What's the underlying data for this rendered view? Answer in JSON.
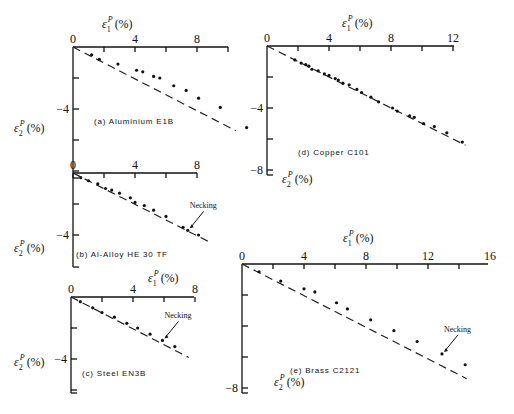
{
  "figure": {
    "x_axis_label": "ε1ᴾ (%)",
    "y_axis_label": "ε2ᴾ (%)",
    "necking_label": "Necking"
  },
  "chart_data": [
    {
      "id": "a",
      "type": "scatter",
      "title": "(a) Aluminium E1B",
      "xlabel": "ε1ᴾ (%)",
      "ylabel": "ε2ᴾ (%)",
      "xlim": [
        0,
        10
      ],
      "ylim": [
        -5.8,
        0
      ],
      "x_ticks": [
        0,
        4,
        8
      ],
      "y_ticks": [
        -4
      ],
      "fit_line": {
        "x": [
          0,
          10.5
        ],
        "y": [
          0,
          -5.4
        ],
        "style": "dashed"
      },
      "points": [
        [
          1.2,
          -0.5
        ],
        [
          1.7,
          -0.8
        ],
        [
          2.9,
          -1.1
        ],
        [
          4.1,
          -1.5
        ],
        [
          4.5,
          -1.6
        ],
        [
          5.2,
          -1.9
        ],
        [
          5.6,
          -2.0
        ],
        [
          6.5,
          -2.5
        ],
        [
          7.3,
          -2.8
        ],
        [
          8.1,
          -3.3
        ],
        [
          9.5,
          -3.9
        ],
        [
          11.2,
          -5.2
        ]
      ],
      "annotations": []
    },
    {
      "id": "b",
      "type": "scatter",
      "title": "(b) Al-Alloy HE 30 TF",
      "xlabel": "ε1ᴾ (%)",
      "ylabel": "ε2ᴾ (%)",
      "xlim": [
        0,
        8
      ],
      "ylim": [
        -6,
        0
      ],
      "x_ticks": [
        0,
        4,
        8
      ],
      "y_ticks": [
        -4
      ],
      "fit_line": {
        "x": [
          0,
          8.7
        ],
        "y": [
          0,
          -4.4
        ],
        "style": "dashed"
      },
      "points": [
        [
          0.5,
          -0.3
        ],
        [
          1.0,
          -0.5
        ],
        [
          1.6,
          -0.7
        ],
        [
          2.1,
          -1.0
        ],
        [
          2.5,
          -1.1
        ],
        [
          3.0,
          -1.3
        ],
        [
          3.7,
          -1.6
        ],
        [
          4.0,
          -1.9
        ],
        [
          4.6,
          -2.1
        ],
        [
          5.2,
          -2.4
        ],
        [
          6.0,
          -2.8
        ],
        [
          7.1,
          -3.5
        ],
        [
          7.4,
          -3.7
        ],
        [
          8.1,
          -4.0
        ]
      ],
      "annotations": [
        {
          "text": "Necking",
          "x": 7.4,
          "y": -3.7
        }
      ]
    },
    {
      "id": "c",
      "type": "scatter",
      "title": "(c) Steel EN3B",
      "xlabel": "ε1ᴾ (%)",
      "ylabel": "ε2ᴾ (%)",
      "xlim": [
        0,
        8
      ],
      "ylim": [
        -6,
        0
      ],
      "x_ticks": [
        0,
        4,
        8
      ],
      "y_ticks": [
        -4
      ],
      "fit_line": {
        "x": [
          0,
          7.6
        ],
        "y": [
          0,
          -3.9
        ],
        "style": "dashed"
      },
      "points": [
        [
          0.6,
          -0.3
        ],
        [
          1.4,
          -0.7
        ],
        [
          2.0,
          -1.0
        ],
        [
          2.8,
          -1.3
        ],
        [
          3.6,
          -1.7
        ],
        [
          4.3,
          -2.0
        ],
        [
          5.1,
          -2.4
        ],
        [
          5.9,
          -2.8
        ],
        [
          6.7,
          -3.2
        ]
      ],
      "annotations": [
        {
          "text": "Necking",
          "x": 5.9,
          "y": -2.8
        }
      ]
    },
    {
      "id": "d",
      "type": "scatter",
      "title": "(d) Copper C101",
      "xlabel": "ε1ᴾ (%)",
      "ylabel": "ε2ᴾ (%)",
      "xlim": [
        0,
        12
      ],
      "ylim": [
        -8,
        0
      ],
      "x_ticks": [
        0,
        4,
        8,
        12
      ],
      "y_ticks": [
        -4,
        -8
      ],
      "fit_line": {
        "x": [
          0,
          12.8
        ],
        "y": [
          0,
          -6.4
        ],
        "style": "dashed"
      },
      "points": [
        [
          1.8,
          -0.9
        ],
        [
          2.2,
          -1.1
        ],
        [
          2.5,
          -1.2
        ],
        [
          2.7,
          -1.3
        ],
        [
          2.9,
          -1.5
        ],
        [
          3.3,
          -1.6
        ],
        [
          3.7,
          -1.8
        ],
        [
          4.0,
          -1.9
        ],
        [
          4.4,
          -2.1
        ],
        [
          4.6,
          -2.2
        ],
        [
          4.9,
          -2.4
        ],
        [
          5.3,
          -2.5
        ],
        [
          5.8,
          -2.8
        ],
        [
          6.1,
          -3.0
        ],
        [
          6.7,
          -3.3
        ],
        [
          7.2,
          -3.6
        ],
        [
          8.1,
          -4.0
        ],
        [
          8.4,
          -4.2
        ],
        [
          9.2,
          -4.5
        ],
        [
          9.5,
          -4.6
        ],
        [
          10.1,
          -5.0
        ],
        [
          10.8,
          -5.2
        ],
        [
          11.6,
          -5.6
        ],
        [
          12.6,
          -6.2
        ]
      ],
      "annotations": []
    },
    {
      "id": "e",
      "type": "scatter",
      "title": "(e) Brass C2121",
      "xlabel": "ε1ᴾ (%)",
      "ylabel": "ε2ᴾ (%)",
      "xlim": [
        0,
        16
      ],
      "ylim": [
        -8,
        0
      ],
      "x_ticks": [
        0,
        4,
        8,
        12,
        16
      ],
      "y_ticks": [
        -8
      ],
      "fit_line": {
        "x": [
          0,
          14.5
        ],
        "y": [
          0,
          -7.4
        ],
        "style": "dashed"
      },
      "points": [
        [
          1.1,
          -0.5
        ],
        [
          2.5,
          -1.1
        ],
        [
          4.0,
          -1.6
        ],
        [
          4.7,
          -1.8
        ],
        [
          6.1,
          -2.5
        ],
        [
          6.8,
          -2.9
        ],
        [
          8.3,
          -3.6
        ],
        [
          9.8,
          -4.3
        ],
        [
          11.3,
          -5.0
        ],
        [
          12.9,
          -5.8
        ],
        [
          14.4,
          -6.5
        ]
      ],
      "annotations": [
        {
          "text": "Necking",
          "x": 12.9,
          "y": -5.8
        }
      ]
    }
  ]
}
